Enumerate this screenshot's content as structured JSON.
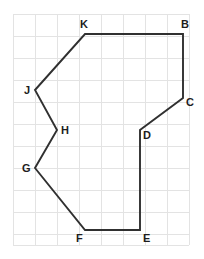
{
  "figure": {
    "type": "polygon-on-grid",
    "canvas": {
      "width": 204,
      "height": 259
    },
    "colors": {
      "background": "#ffffff",
      "grid": "#e3e3e3",
      "stroke": "#303030",
      "label": "#1d1d1d"
    },
    "grid": {
      "origin_x": 13,
      "origin_y": 14,
      "cell": 22,
      "columns": 8,
      "rows": 10.5,
      "right": 189,
      "bottom": 245,
      "visible": true
    },
    "polygon": {
      "closed": true,
      "stroke_width": 1.9,
      "vertex_order": [
        "B",
        "C",
        "D",
        "E",
        "F",
        "G",
        "H",
        "J",
        "K"
      ],
      "vertices": [
        {
          "id": "B",
          "x": 183,
          "y": 34,
          "label": "B",
          "label_dx": -2,
          "label_dy": -15,
          "label_anchor": "start"
        },
        {
          "id": "C",
          "x": 183,
          "y": 98,
          "label": "C",
          "label_dx": 3,
          "label_dy": -1,
          "label_anchor": "start"
        },
        {
          "id": "D",
          "x": 140,
          "y": 130,
          "label": "D",
          "label_dx": 3,
          "label_dy": 0,
          "label_anchor": "start"
        },
        {
          "id": "E",
          "x": 140,
          "y": 230,
          "label": "E",
          "label_dx": 3,
          "label_dy": 3,
          "label_anchor": "start"
        },
        {
          "id": "F",
          "x": 85,
          "y": 230,
          "label": "F",
          "label_dx": -9,
          "label_dy": 3,
          "label_anchor": "start"
        },
        {
          "id": "G",
          "x": 35,
          "y": 168,
          "label": "G",
          "label_dx": -13,
          "label_dy": -5,
          "label_anchor": "start"
        },
        {
          "id": "H",
          "x": 57,
          "y": 130,
          "label": "H",
          "label_dx": 4,
          "label_dy": -5,
          "label_anchor": "start"
        },
        {
          "id": "J",
          "x": 35,
          "y": 90,
          "label": "J",
          "label_dx": -11,
          "label_dy": -5,
          "label_anchor": "start"
        },
        {
          "id": "K",
          "x": 85,
          "y": 34,
          "label": "K",
          "label_dx": -5,
          "label_dy": -15,
          "label_anchor": "start"
        }
      ],
      "edges": [
        {
          "from": "B",
          "to": "C",
          "orientation": "vertical"
        },
        {
          "from": "C",
          "to": "D",
          "orientation": "diagonal"
        },
        {
          "from": "D",
          "to": "E",
          "orientation": "vertical"
        },
        {
          "from": "E",
          "to": "F",
          "orientation": "horizontal"
        },
        {
          "from": "F",
          "to": "G",
          "orientation": "diagonal"
        },
        {
          "from": "G",
          "to": "H",
          "orientation": "diagonal"
        },
        {
          "from": "H",
          "to": "J",
          "orientation": "diagonal"
        },
        {
          "from": "J",
          "to": "K",
          "orientation": "diagonal"
        },
        {
          "from": "K",
          "to": "B",
          "orientation": "horizontal"
        }
      ]
    }
  }
}
